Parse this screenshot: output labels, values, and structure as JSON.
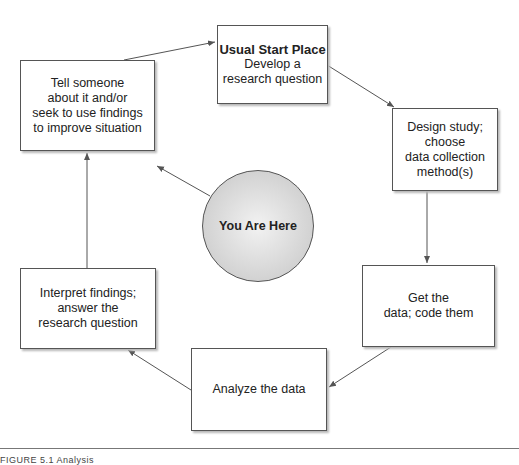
{
  "diagram": {
    "type": "cycle",
    "center": {
      "label": "You Are Here"
    },
    "steps": [
      {
        "id": "start",
        "title": "Usual Start Place",
        "lines": [
          "Develop a",
          "research question"
        ]
      },
      {
        "id": "design",
        "lines": [
          "Design study; choose",
          "data collection",
          "method(s)"
        ]
      },
      {
        "id": "get-data",
        "lines": [
          "Get the",
          "data; code them"
        ]
      },
      {
        "id": "analyze",
        "lines": [
          "Analyze the data"
        ]
      },
      {
        "id": "interpret",
        "lines": [
          "Interpret findings;",
          "answer the",
          "research question"
        ]
      },
      {
        "id": "tell",
        "lines": [
          "Tell someone",
          "about it and/or",
          "seek to use findings",
          "to improve situation"
        ]
      }
    ],
    "colors": {
      "box_border": "#555555",
      "arrow": "#555555",
      "circle_fill": "#d2d2d2"
    }
  },
  "caption": "FIGURE 5.1   Analysis"
}
